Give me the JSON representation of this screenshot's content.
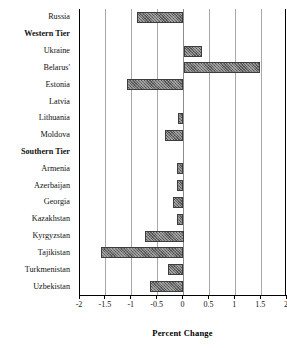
{
  "chart_data": {
    "type": "bar",
    "orientation": "horizontal",
    "title": "",
    "xlabel": "Percent Change",
    "ylabel": "",
    "xlim": [
      -2,
      2
    ],
    "xticks": [
      -2,
      -1.5,
      -1,
      -0.5,
      0,
      0.5,
      1,
      1.5,
      2
    ],
    "xtick_labels": [
      "-2",
      "-1.5",
      "-1",
      "-0.5",
      "0",
      "0.5",
      "1",
      "1.5",
      "2"
    ],
    "grid": true,
    "legend": "none",
    "bar_color": "#6e6e6e",
    "bar_edge_color": "#3d3d3d",
    "bar_pattern": "hatched",
    "categories": [
      "Russia",
      "Western Tier",
      "Ukraine",
      "Belarus'",
      "Estonia",
      "Latvia",
      "Lithuania",
      "Moldova",
      "Southern Tier",
      "Armenia",
      "Azerbaijan",
      "Georgia",
      "Kazakhstan",
      "Kyrgyzstan",
      "Tajikistan",
      "Turkmenistan",
      "Uzbekistan"
    ],
    "group_headers": [
      "Western Tier",
      "Southern Tier"
    ],
    "values": [
      -0.9,
      null,
      0.35,
      1.47,
      -1.1,
      0.0,
      -0.1,
      -0.35,
      null,
      -0.12,
      -0.12,
      -0.2,
      -0.12,
      -0.75,
      -1.6,
      -0.3,
      -0.65
    ],
    "rows": [
      {
        "label": "Russia",
        "value": -0.9,
        "is_header": false
      },
      {
        "label": "Western Tier",
        "value": null,
        "is_header": true
      },
      {
        "label": "Ukraine",
        "value": 0.35,
        "is_header": false
      },
      {
        "label": "Belarus'",
        "value": 1.47,
        "is_header": false
      },
      {
        "label": "Estonia",
        "value": -1.1,
        "is_header": false
      },
      {
        "label": "Latvia",
        "value": 0.0,
        "is_header": false
      },
      {
        "label": "Lithuania",
        "value": -0.1,
        "is_header": false
      },
      {
        "label": "Moldova",
        "value": -0.35,
        "is_header": false
      },
      {
        "label": "Southern Tier",
        "value": null,
        "is_header": true
      },
      {
        "label": "Armenia",
        "value": -0.12,
        "is_header": false
      },
      {
        "label": "Azerbaijan",
        "value": -0.12,
        "is_header": false
      },
      {
        "label": "Georgia",
        "value": -0.2,
        "is_header": false
      },
      {
        "label": "Kazakhstan",
        "value": -0.12,
        "is_header": false
      },
      {
        "label": "Kyrgyzstan",
        "value": -0.75,
        "is_header": false
      },
      {
        "label": "Tajikistan",
        "value": -1.6,
        "is_header": false
      },
      {
        "label": "Turkmenistan",
        "value": -0.3,
        "is_header": false
      },
      {
        "label": "Uzbekistan",
        "value": -0.65,
        "is_header": false
      }
    ]
  }
}
